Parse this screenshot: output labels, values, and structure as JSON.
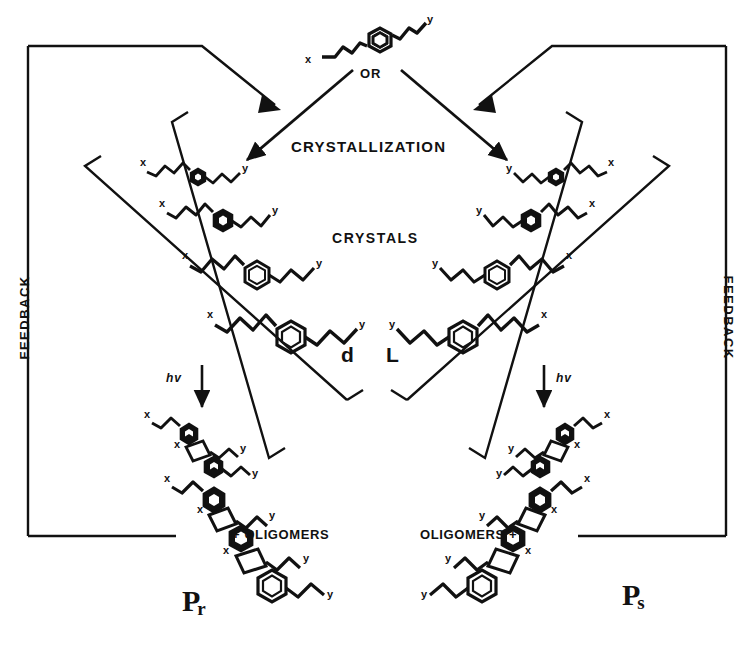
{
  "figure": {
    "labels": {
      "or": "OR",
      "crystallization": "CRYSTALLIZATION",
      "crystals": "CRYSTALS",
      "feedback_left": "FEEDBACK",
      "feedback_right": "FEEDBACK",
      "hv_left": "hv",
      "hv_right": "hv",
      "oligomers_left": "+ OLIGOMERS",
      "oligomers_right": "OLIGOMERS +",
      "chirality_left": "d",
      "chirality_right": "L",
      "polymer_left_main": "P",
      "polymer_left_sub": "r",
      "polymer_right_main": "P",
      "polymer_right_sub": "s"
    },
    "monomer": {
      "substituent_left": "x",
      "substituent_right": "y"
    },
    "stacks": {
      "left_labels": [
        {
          "top": "x",
          "bottom": "y"
        },
        {
          "top": "x",
          "bottom": "y"
        },
        {
          "top": "x",
          "bottom": "y"
        },
        {
          "top": "x",
          "bottom": "y"
        }
      ],
      "right_labels": [
        {
          "top": "x",
          "bottom": "y"
        },
        {
          "top": "x",
          "bottom": "y"
        },
        {
          "top": "x",
          "bottom": "y"
        },
        {
          "top": "x",
          "bottom": "y"
        }
      ]
    },
    "polymers": {
      "left_labels": [
        "x",
        "x",
        "y",
        "x",
        "x",
        "y",
        "y"
      ],
      "right_labels": [
        "x",
        "x",
        "y",
        "x",
        "x",
        "y",
        "y"
      ]
    },
    "colors": {
      "ink": "#111111",
      "background": "#ffffff"
    }
  }
}
